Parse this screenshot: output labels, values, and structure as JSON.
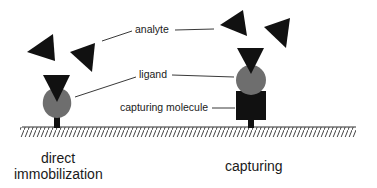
{
  "diagram": {
    "labels": {
      "analyte": "analyte",
      "ligand": "ligand",
      "capturing_molecule": "capturing molecule",
      "direct_line1": "direct",
      "direct_line2": "immobilization",
      "capturing": "capturing"
    },
    "colors": {
      "analyte": "#111111",
      "ligand": "#6e6e6e",
      "capturing_molecule": "#111111",
      "anchor": "#111111",
      "surface": "#333333"
    }
  }
}
